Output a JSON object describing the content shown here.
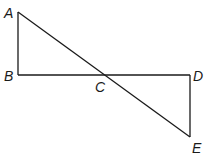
{
  "diagram": {
    "type": "geometry",
    "points": {
      "A": {
        "label": "A",
        "x": 18,
        "y": 12
      },
      "B": {
        "label": "B",
        "x": 18,
        "y": 75
      },
      "C": {
        "label": "C",
        "x": 103,
        "y": 75
      },
      "D": {
        "label": "D",
        "x": 190,
        "y": 75
      },
      "E": {
        "label": "E",
        "x": 190,
        "y": 137
      }
    },
    "segments": [
      "AB",
      "BD",
      "DE",
      "AE"
    ],
    "colors": {
      "stroke": "#1a1a1a",
      "background": "#ffffff"
    }
  }
}
